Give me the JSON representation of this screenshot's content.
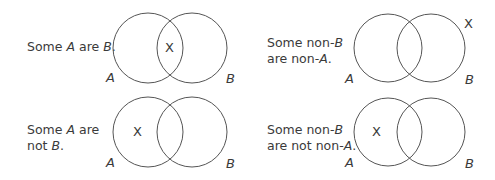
{
  "diagrams": [
    {
      "id": "some-a-are-b",
      "statement_parts": [
        "Some ",
        "A",
        " are ",
        "B",
        "."
      ],
      "statement_lines": 1,
      "circle_labels": [
        "A",
        "B"
      ],
      "marker": "X",
      "marker_region": "A and B (intersection)"
    },
    {
      "id": "some-non-b-are-non-a",
      "statement_line1": [
        "Some non-",
        "B"
      ],
      "statement_line2": [
        "are non-",
        "A",
        "."
      ],
      "circle_labels": [
        "A",
        "B"
      ],
      "marker": "X",
      "marker_region": "outside both circles"
    },
    {
      "id": "some-a-are-not-b",
      "statement_line1": [
        "Some ",
        "A",
        " are"
      ],
      "statement_line2": [
        "not ",
        "B",
        "."
      ],
      "circle_labels": [
        "A",
        "B"
      ],
      "marker": "X",
      "marker_region": "A only"
    },
    {
      "id": "some-non-b-are-not-non-a",
      "statement_line1": [
        "Some non-",
        "B"
      ],
      "statement_line2": [
        "are not non-",
        "A",
        "."
      ],
      "circle_labels": [
        "A",
        "B"
      ],
      "marker": "X",
      "marker_region": "A only"
    }
  ],
  "colors": {
    "stroke": "#555555",
    "text": "#3a3a3a",
    "background": "#ffffff"
  }
}
